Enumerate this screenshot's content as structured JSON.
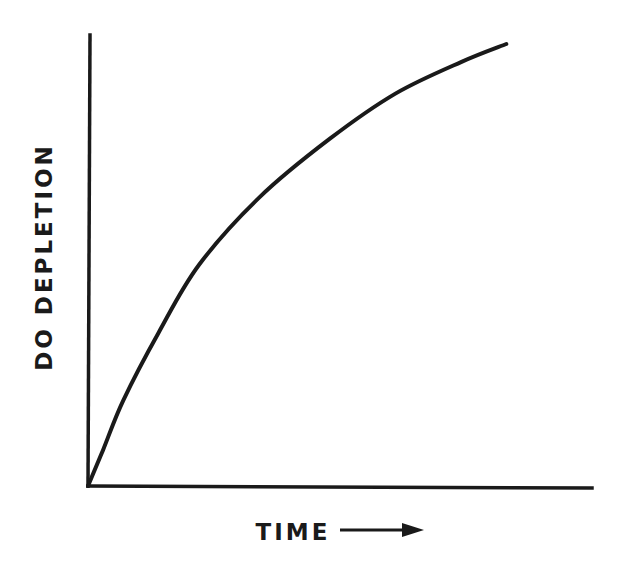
{
  "chart_data": {
    "type": "line",
    "title": "",
    "xlabel": "TIME",
    "ylabel": "DO DEPLETION",
    "x_axis_arrow": true,
    "ticks": false,
    "grid": false,
    "legend": null,
    "xlim": [
      0,
      1
    ],
    "ylim": [
      0,
      1
    ],
    "series": [
      {
        "name": "DO depletion",
        "x": [
          0.0,
          0.03,
          0.07,
          0.14,
          0.22,
          0.34,
          0.48,
          0.61,
          0.74,
          0.83
        ],
        "y": [
          0.0,
          0.08,
          0.19,
          0.34,
          0.49,
          0.64,
          0.77,
          0.87,
          0.94,
          0.98
        ]
      }
    ]
  },
  "colors": {
    "ink": "#1a1a1a",
    "background": "#ffffff"
  }
}
